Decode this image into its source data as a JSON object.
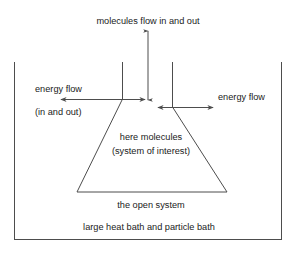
{
  "diagram": {
    "stroke_color": "#4d4d4d",
    "text_color": "#1a1a1a",
    "background_color": "#ffffff",
    "labels": {
      "molecules_flow": "molecules flow in and out",
      "energy_flow_left": "energy flow",
      "energy_flow_left_sub": "(in and out)",
      "energy_flow_right": "energy flow",
      "system_line1": "here molecules",
      "system_line2": "(system of interest)",
      "open_system": "the open system",
      "bath": "large heat bath and particle bath"
    },
    "shapes": {
      "bath_box": {
        "left": 14,
        "right": 281,
        "bottom": 239
      },
      "flask_neck_left_x": 122,
      "flask_neck_right_x": 172,
      "flask_neck_top_y": 62,
      "flask_shoulder_left_y": 99,
      "flask_shoulder_right_y": 107,
      "flask_base_left_x": 77,
      "flask_base_right_x": 227,
      "flask_base_y": 192
    },
    "arrows": {
      "molecules_vertical": {
        "x": 148,
        "y_top": 30,
        "y_bottom": 101,
        "heads": "both"
      },
      "energy_left": {
        "y": 99,
        "x_start": 60,
        "x_end": 146,
        "heads": "both"
      },
      "energy_right": {
        "y": 107,
        "x_start": 157,
        "x_end": 214,
        "heads": "both"
      }
    }
  }
}
